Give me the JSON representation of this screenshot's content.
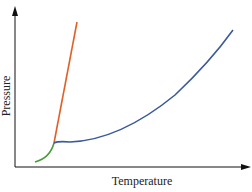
{
  "diagram": {
    "type": "phase-diagram",
    "x_axis_label": "Temperature",
    "y_axis_label": "Pressure",
    "curves": [
      {
        "name": "sublimation-curve",
        "color": "#4a9a3c",
        "from": "lower-left",
        "to": "triple-point"
      },
      {
        "name": "melting-curve",
        "color": "#e0602a",
        "from": "triple-point",
        "to": "top"
      },
      {
        "name": "vaporization-curve",
        "color": "#3a5a9a",
        "from": "triple-point",
        "to": "upper-right"
      }
    ],
    "colors": {
      "axis": "#111111",
      "sublimation": "#4a9a3c",
      "melting": "#e0602a",
      "vaporization": "#3a5a9a"
    }
  }
}
